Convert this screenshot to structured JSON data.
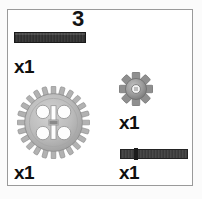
{
  "step": {
    "number": "3"
  },
  "colors": {
    "frame_border": "#9a9a9a",
    "background": "#ffffff",
    "text": "#0f0f0f",
    "beam_dark": "#2e2e2e",
    "axle_dark": "#3a3a3a",
    "gear_gray": "#b6b6b6",
    "gear_gray_dark": "#8e8e8e",
    "gear_small_gray": "#9e9e9e"
  },
  "parts": [
    {
      "id": "beam-long",
      "name": "black-technic-axle-long",
      "icon": "beam-icon",
      "quantity_label": "x1"
    },
    {
      "id": "gear-big",
      "name": "gear-24-tooth",
      "icon": "gear-large-icon",
      "teeth": 24,
      "quantity_label": "x1"
    },
    {
      "id": "gear-small",
      "name": "gear-8-tooth",
      "icon": "gear-small-icon",
      "teeth": 8,
      "quantity_label": "x1"
    },
    {
      "id": "axle-short",
      "name": "black-technic-axle-short-with-stop",
      "icon": "axle-icon",
      "quantity_label": "x1"
    }
  ]
}
